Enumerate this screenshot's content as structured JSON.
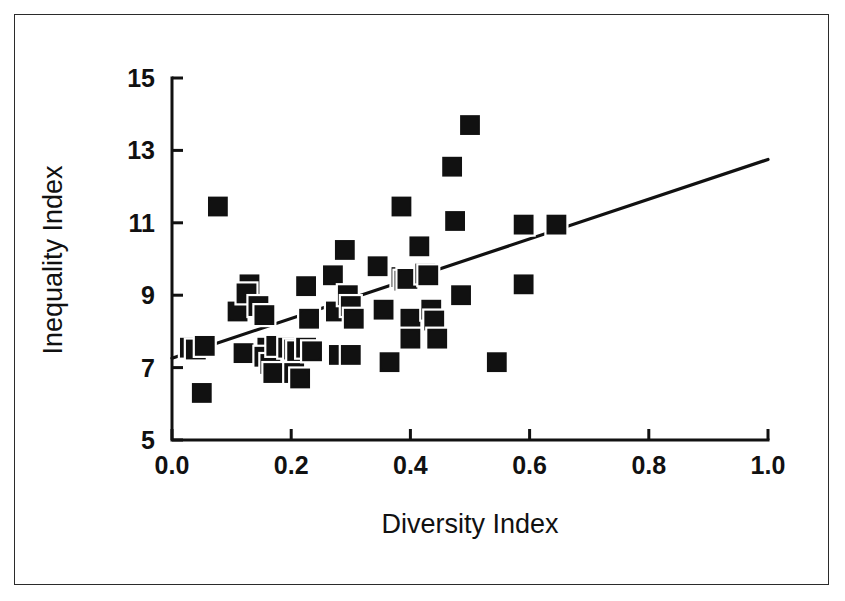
{
  "figure": {
    "border_color": "#2b2b2b",
    "background": "#ffffff"
  },
  "chart_data": {
    "type": "scatter",
    "title": "",
    "xlabel": "Diversity Index",
    "ylabel": "Inequality Index",
    "xlim": [
      0.0,
      1.0
    ],
    "ylim": [
      5,
      15
    ],
    "xticks": [
      "0.0",
      "0.2",
      "0.4",
      "0.6",
      "0.8",
      "1.0"
    ],
    "xtick_values": [
      0.0,
      0.2,
      0.4,
      0.6,
      0.8,
      1.0
    ],
    "yticks": [
      "5",
      "7",
      "9",
      "11",
      "13",
      "15"
    ],
    "ytick_values": [
      5,
      7,
      9,
      11,
      13,
      15
    ],
    "grid": false,
    "legend": "none",
    "marker": "filled-square",
    "marker_color": "#111111",
    "points": [
      [
        0.05,
        6.3
      ],
      [
        0.077,
        11.45
      ],
      [
        0.03,
        7.55
      ],
      [
        0.04,
        7.5
      ],
      [
        0.055,
        7.6
      ],
      [
        0.11,
        8.55
      ],
      [
        0.12,
        7.4
      ],
      [
        0.13,
        9.3
      ],
      [
        0.125,
        9.05
      ],
      [
        0.145,
        8.7
      ],
      [
        0.155,
        8.45
      ],
      [
        0.16,
        7.55
      ],
      [
        0.155,
        7.3
      ],
      [
        0.165,
        7.1
      ],
      [
        0.17,
        6.85
      ],
      [
        0.175,
        7.6
      ],
      [
        0.195,
        7.55
      ],
      [
        0.205,
        7.5
      ],
      [
        0.21,
        7.45
      ],
      [
        0.205,
        6.85
      ],
      [
        0.215,
        6.7
      ],
      [
        0.225,
        9.25
      ],
      [
        0.23,
        8.35
      ],
      [
        0.225,
        7.55
      ],
      [
        0.235,
        7.45
      ],
      [
        0.27,
        9.55
      ],
      [
        0.275,
        8.55
      ],
      [
        0.28,
        7.35
      ],
      [
        0.29,
        10.25
      ],
      [
        0.295,
        9.0
      ],
      [
        0.3,
        8.7
      ],
      [
        0.305,
        8.35
      ],
      [
        0.3,
        7.35
      ],
      [
        0.345,
        9.8
      ],
      [
        0.355,
        8.6
      ],
      [
        0.365,
        7.15
      ],
      [
        0.385,
        11.45
      ],
      [
        0.385,
        9.5
      ],
      [
        0.39,
        9.4
      ],
      [
        0.395,
        9.45
      ],
      [
        0.4,
        8.35
      ],
      [
        0.4,
        7.8
      ],
      [
        0.415,
        10.35
      ],
      [
        0.425,
        9.6
      ],
      [
        0.43,
        9.55
      ],
      [
        0.435,
        8.6
      ],
      [
        0.44,
        8.3
      ],
      [
        0.445,
        7.8
      ],
      [
        0.47,
        12.55
      ],
      [
        0.5,
        13.7
      ],
      [
        0.475,
        11.05
      ],
      [
        0.485,
        9.0
      ],
      [
        0.545,
        7.15
      ],
      [
        0.59,
        10.95
      ],
      [
        0.59,
        9.3
      ],
      [
        0.645,
        10.95
      ]
    ],
    "fit_line": {
      "x": [
        0.0,
        1.0
      ],
      "y": [
        7.26,
        12.75
      ],
      "label": "linear-regression-line"
    }
  }
}
